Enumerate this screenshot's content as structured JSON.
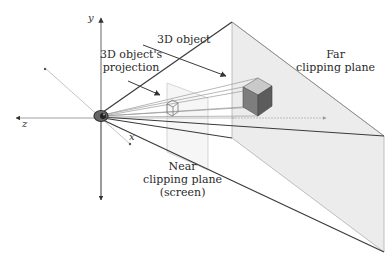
{
  "diagram": {
    "type": "perspective view frustum",
    "axes": {
      "y": "y",
      "z": "z",
      "x": "x"
    },
    "labels": {
      "object": "3D object",
      "projection_line1": "3D object's",
      "projection_line2": "projection",
      "far_line1": "Far",
      "far_line2": "clipping plane",
      "near_line1": "Near",
      "near_line2": "clipping plane",
      "near_line3": "(screen)"
    },
    "colors": {
      "far_plane_fill": "#ededed",
      "cube_top": "#c8c8c8",
      "cube_front": "#7a7a7a",
      "cube_side": "#5e5e5e",
      "line_dark": "#3a3a3a",
      "line_light": "#b5b5b5"
    }
  }
}
